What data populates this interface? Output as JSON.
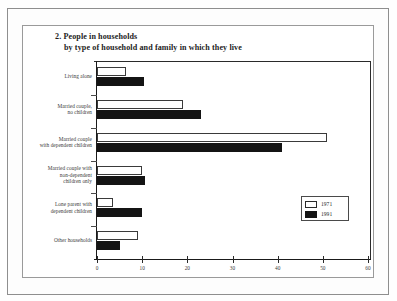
{
  "figure": {
    "title_line1": "2. People in households",
    "title_line2": "by type of household and family in which they live"
  },
  "legend": {
    "entries": [
      {
        "label": "1971",
        "color": "#ffffff",
        "style": "hollow"
      },
      {
        "label": "1991",
        "color": "#141414",
        "style": "filled"
      }
    ]
  },
  "chart_data": {
    "type": "bar",
    "orientation": "horizontal",
    "title": "2. People in households by type of household and family in which they live",
    "xlabel": "",
    "ylabel": "",
    "xlim": [
      0,
      60
    ],
    "xticks": [
      0,
      10,
      20,
      30,
      40,
      50,
      60
    ],
    "xtick_labels": [
      "0",
      "10",
      "20",
      "30",
      "40",
      "50",
      "60"
    ],
    "grid": false,
    "legend_position": "middle-right",
    "categories": [
      "Living alone",
      "Married couple, no children",
      "Married couple with dependent children",
      "Married couple with non-dependent children only",
      "Lone parent with dependent children",
      "Other households"
    ],
    "category_lines": [
      [
        "Living alone"
      ],
      [
        "Married couple,",
        "no children"
      ],
      [
        "Married couple",
        "with dependent children"
      ],
      [
        "Married couple with",
        "non-dependent",
        "children only"
      ],
      [
        "Lone parent with",
        "dependent children"
      ],
      [
        "Other households"
      ]
    ],
    "series": [
      {
        "name": "1971",
        "values": [
          6.5,
          19,
          51,
          10,
          3.5,
          9
        ]
      },
      {
        "name": "1991",
        "values": [
          10.5,
          23,
          41,
          10.7,
          10,
          5
        ]
      }
    ]
  }
}
